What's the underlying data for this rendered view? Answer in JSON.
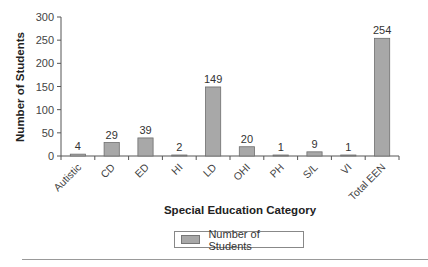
{
  "chart_data": {
    "type": "bar",
    "title": "",
    "xlabel": "Special Education Category",
    "ylabel": "Number of Students",
    "ylim": [
      0,
      300
    ],
    "yticks": [
      0,
      50,
      100,
      150,
      200,
      250,
      300
    ],
    "grid": false,
    "legend_position": "bottom",
    "categories": [
      "Autistic",
      "CD",
      "ED",
      "HI",
      "LD",
      "OHI",
      "PH",
      "S/L",
      "VI",
      "Total EEN"
    ],
    "series": [
      {
        "name": "Number of Students",
        "values": [
          4,
          29,
          39,
          2,
          149,
          20,
          1,
          9,
          1,
          254
        ],
        "color": "#a8a8a8"
      }
    ]
  },
  "legend": {
    "label": "Number of Students"
  },
  "colors": {
    "bar_fill": "#a8a8a8",
    "bar_stroke": "#6e6e6e",
    "axis": "#555555"
  }
}
